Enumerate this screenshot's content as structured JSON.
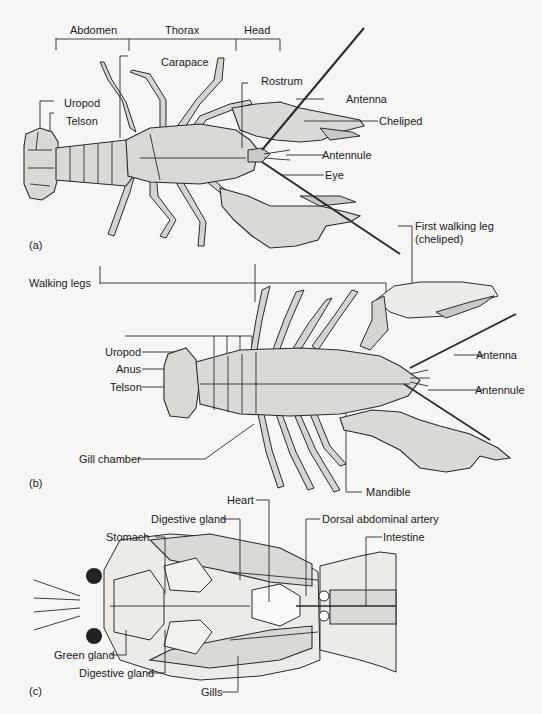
{
  "figure": {
    "panels": [
      {
        "id": "a",
        "panel_label": "(a)",
        "region_brackets": [
          "Abdomen",
          "Thorax",
          "Head"
        ],
        "labels": {
          "carapace": "Carapace",
          "rostrum": "Rostrum",
          "uropod": "Uropod",
          "telson": "Telson",
          "antenna": "Antenna",
          "cheliped": "Cheliped",
          "antennule": "Antennule",
          "eye": "Eye"
        }
      },
      {
        "id": "b",
        "panel_label": "(b)",
        "labels": {
          "walking_legs": "Walking legs",
          "first_walking_leg": "First walking leg",
          "first_walking_leg_sub": "(cheliped)",
          "uropod": "Uropod",
          "anus": "Anus",
          "telson": "Telson",
          "antenna": "Antenna",
          "antennule": "Antennule",
          "gill_chamber": "Gill chamber",
          "mandible": "Mandible"
        }
      },
      {
        "id": "c",
        "panel_label": "(c)",
        "labels": {
          "heart": "Heart",
          "digestive_gland_top": "Digestive gland",
          "dorsal_abdominal_artery": "Dorsal abdominal artery",
          "stomach": "Stomach",
          "intestine": "Intestine",
          "green_gland": "Green gland",
          "digestive_gland_bottom": "Digestive gland",
          "gills": "Gills"
        }
      }
    ]
  }
}
